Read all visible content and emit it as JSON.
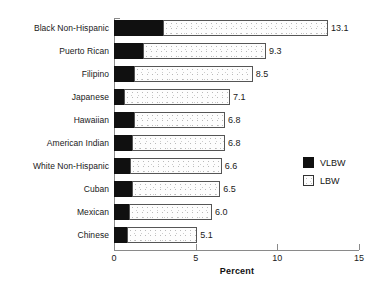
{
  "chart_data": {
    "type": "bar",
    "orientation": "horizontal",
    "stacked": true,
    "title": "",
    "subtitle": "",
    "xlabel": "Percent",
    "ylabel": "",
    "xlim": [
      0,
      15
    ],
    "xticks": [
      0,
      5,
      10,
      15
    ],
    "xtick_labels": [
      "0",
      "5",
      "10",
      "15"
    ],
    "grid": false,
    "legend_position": "right",
    "categories": [
      "Black Non-Hispanic",
      "Puerto Rican",
      "Filipino",
      "Japanese",
      "Hawaiian",
      "American Indian",
      "White Non-Hispanic",
      "Cuban",
      "Mexican",
      "Chinese"
    ],
    "series": [
      {
        "name": "VLBW",
        "color": "#101010",
        "values": [
          3.0,
          1.8,
          1.2,
          0.6,
          1.2,
          1.1,
          1.0,
          1.1,
          0.9,
          0.8
        ]
      },
      {
        "name": "LBW",
        "color": "#fdfdfd",
        "values": [
          10.1,
          7.5,
          7.3,
          6.5,
          5.6,
          5.7,
          5.6,
          5.4,
          5.1,
          4.3
        ]
      }
    ],
    "totals": [
      13.1,
      9.3,
      8.5,
      7.1,
      6.8,
      6.8,
      6.6,
      6.5,
      6.0,
      5.1
    ],
    "total_labels": [
      "13.1",
      "9.3",
      "8.5",
      "7.1",
      "6.8",
      "6.8",
      "6.6",
      "6.5",
      "6.0",
      "5.1"
    ]
  },
  "legend": {
    "items": [
      {
        "label": "VLBW",
        "swatch": "filled-black-square"
      },
      {
        "label": "LBW",
        "swatch": "stippled-white-square"
      }
    ]
  },
  "axis": {
    "x_title": "Percent",
    "ticks": [
      {
        "label": "0",
        "value": 0
      },
      {
        "label": "5",
        "value": 5
      },
      {
        "label": "10",
        "value": 10
      },
      {
        "label": "15",
        "value": 15
      }
    ]
  },
  "colors": {
    "vlbw": "#101010",
    "lbw": "#fdfdfd",
    "axis": "#8a8a8a",
    "text": "#1a1a1a",
    "background": "#ffffff"
  }
}
